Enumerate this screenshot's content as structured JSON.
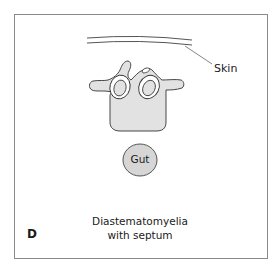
{
  "figure": {
    "panel_letter": "D",
    "caption_line1": "Diastematomyelia",
    "caption_line2": "with septum",
    "labels": {
      "skin": "Skin",
      "gut": "Gut"
    },
    "colors": {
      "frame": "#8a8a8a",
      "fill": "#e2e2e2",
      "outline": "#333333",
      "text": "#1a1a1a"
    }
  }
}
